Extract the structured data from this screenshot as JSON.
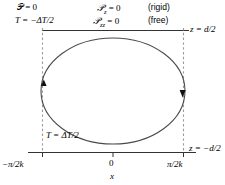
{
  "figure": {
    "type": "schematic-diagram",
    "width": 225,
    "height": 185,
    "colors": {
      "stroke": "#000000",
      "ellipse": "#3a3a3a",
      "dashed": "#808080",
      "background": "#ffffff"
    }
  },
  "boundary_conditions": {
    "top_left": {
      "pressure": "𝒫 = 0",
      "temperature": "T = −ΔT/2"
    },
    "top_middle": {
      "rigid_condition": "𝒫z = 0",
      "free_condition": "𝒫zz = 0"
    },
    "top_right": {
      "rigid_label": "(rigid)",
      "free_label": "(free)"
    },
    "bottom_left": {
      "temperature": "T = ΔT/2"
    }
  },
  "axes": {
    "z_top": "z = d/2",
    "z_bottom": "z = −d/2",
    "x_label": "x",
    "x_ticks": [
      {
        "label": "−π/2k",
        "position": "left"
      },
      {
        "label": "0",
        "position": "center"
      },
      {
        "label": "π/2k",
        "position": "right"
      }
    ]
  },
  "glyphs": {
    "P": "𝒫",
    "T": "T",
    "delta": "Δ",
    "pi": "π",
    "minus": "−",
    "sub_z": "z",
    "sub_zz": "zz"
  },
  "roll": {
    "shape": "ellipse",
    "arrow_left": "arrow-up",
    "arrow_right": "arrow-down",
    "circulation": "clockwise"
  }
}
